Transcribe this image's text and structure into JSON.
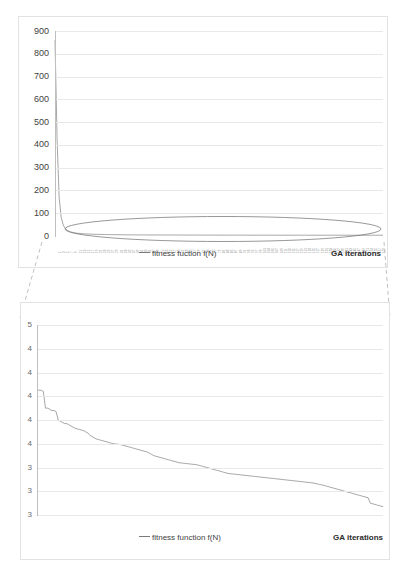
{
  "page": {
    "watermark": "",
    "background": "#ffffff"
  },
  "colors": {
    "series": "#7f7f7f",
    "grid": "#e8e8e8",
    "border": "#e2e2e2",
    "text": "#3f3f3f",
    "connector": "#c0c0c0",
    "annotation": "#6b6b6b"
  },
  "top_chart": {
    "legend_label": "fitness fuction f(N)",
    "x_axis_title": "GA iterations",
    "y_ticks": [
      "0",
      "100",
      "200",
      "300",
      "400",
      "500",
      "600",
      "700",
      "800",
      "900"
    ],
    "x_tick_labels": [
      "1",
      "3",
      "5",
      "7",
      "9",
      "11",
      "13",
      "15",
      "17",
      "19",
      "21",
      "23",
      "25",
      "27",
      "29",
      "31",
      "33",
      "35",
      "37",
      "39",
      "41",
      "43",
      "45",
      "47",
      "49",
      "51",
      "53",
      "55",
      "57",
      "59",
      "61",
      "63",
      "65",
      "67",
      "69",
      "71",
      "73",
      "75",
      "77",
      "79",
      "81",
      "83",
      "85",
      "87",
      "89",
      "91",
      "93",
      "95",
      "97",
      "99",
      "101",
      "103",
      "105",
      "107",
      "109",
      "111",
      "113",
      "115",
      "117",
      "119",
      "121",
      "123",
      "125",
      "127",
      "129",
      "131",
      "133",
      "135",
      "137",
      "139",
      "141",
      "143",
      "145",
      "147",
      "149",
      "151",
      "153",
      "155",
      "157",
      "159"
    ],
    "annotation": "ellipse-highlight"
  },
  "bottom_chart": {
    "legend_label": "fitness function f(N)",
    "x_axis_title": "GA iterations",
    "y_ticks": [
      "5",
      "4",
      "4",
      "4",
      "4",
      "4",
      "3",
      "3",
      "3"
    ],
    "y_ticks_full": [
      "5.0",
      "4.8",
      "4.6",
      "4.4",
      "4.2",
      "4.0",
      "3.8",
      "3.6",
      "3.4"
    ]
  },
  "chart_data": [
    {
      "type": "line",
      "id": "top-chart",
      "title": "",
      "xlabel": "GA iterations",
      "ylabel": "",
      "ylim": [
        0,
        900
      ],
      "xlim": [
        1,
        160
      ],
      "grid": true,
      "legend": "bottom-center",
      "series": [
        {
          "name": "fitness fuction f(N)",
          "values": [
            860,
            430,
            170,
            82,
            48,
            33,
            25,
            20,
            17,
            15,
            13,
            12,
            11,
            10,
            9.5,
            9,
            8.6,
            8.2,
            7.9,
            7.6,
            7.3,
            7.1,
            6.9,
            6.7,
            6.5,
            6.3,
            6.1,
            6.0,
            5.8,
            5.7,
            5.6,
            5.5,
            5.4,
            5.3,
            5.2,
            5.1,
            5.0,
            4.95,
            4.9,
            4.85,
            4.8,
            4.75,
            4.7,
            4.65,
            4.6,
            4.58,
            4.56,
            4.54,
            4.52,
            4.5,
            4.48,
            4.46,
            4.44,
            4.42,
            4.4,
            4.38,
            4.36,
            4.34,
            4.32,
            4.3,
            4.28,
            4.26,
            4.24,
            4.22,
            4.2,
            4.18,
            4.16,
            4.14,
            4.12,
            4.1,
            4.08,
            4.06,
            4.04,
            4.02,
            4.0,
            3.98,
            3.96,
            3.94,
            3.92,
            3.9,
            3.88,
            3.86,
            3.84,
            3.82,
            3.8,
            3.79,
            3.78,
            3.77,
            3.76,
            3.75,
            3.74,
            3.73,
            3.72,
            3.71,
            3.7,
            3.69,
            3.68,
            3.67,
            3.66,
            3.65,
            3.64,
            3.63,
            3.62,
            3.61,
            3.6,
            3.59,
            3.58,
            3.57,
            3.56,
            3.55,
            3.55,
            3.54,
            3.54,
            3.53,
            3.53,
            3.52,
            3.52,
            3.51,
            3.51,
            3.5,
            3.5,
            3.5,
            3.49,
            3.49,
            3.49,
            3.48,
            3.48,
            3.48,
            3.48,
            3.47,
            3.47,
            3.47,
            3.47,
            3.47,
            3.47,
            3.47,
            3.47,
            3.47,
            3.47,
            3.47,
            3.47,
            3.47,
            3.47,
            3.47,
            3.47,
            3.47,
            3.47,
            3.47,
            3.47,
            3.47,
            3.47,
            3.47,
            3.47,
            3.47,
            3.47,
            3.47,
            3.47,
            3.47,
            3.47,
            3.47
          ]
        }
      ]
    },
    {
      "type": "line",
      "id": "bottom-chart",
      "title": "",
      "xlabel": "GA iterations",
      "ylabel": "",
      "ylim": [
        3.4,
        5.0
      ],
      "xlim": [
        1,
        160
      ],
      "grid": true,
      "legend": "bottom-center",
      "note": "zoomed detail of the ellipse-highlighted flat region of the top chart",
      "series": [
        {
          "name": "fitness function f(N)",
          "values": [
            4.46,
            4.45,
            4.45,
            4.44,
            4.3,
            4.3,
            4.29,
            4.28,
            4.28,
            4.27,
            4.2,
            4.19,
            4.18,
            4.17,
            4.17,
            4.16,
            4.15,
            4.14,
            4.13,
            4.125,
            4.12,
            4.115,
            4.11,
            4.1,
            4.09,
            4.07,
            4.06,
            4.05,
            4.04,
            4.035,
            4.03,
            4.025,
            4.02,
            4.015,
            4.01,
            4.005,
            4.0,
            3.998,
            3.996,
            3.994,
            3.99,
            3.985,
            3.98,
            3.975,
            3.97,
            3.965,
            3.96,
            3.955,
            3.95,
            3.945,
            3.94,
            3.935,
            3.93,
            3.92,
            3.91,
            3.9,
            3.895,
            3.89,
            3.885,
            3.88,
            3.875,
            3.87,
            3.865,
            3.86,
            3.855,
            3.85,
            3.845,
            3.84,
            3.838,
            3.836,
            3.834,
            3.832,
            3.83,
            3.828,
            3.826,
            3.824,
            3.82,
            3.815,
            3.81,
            3.805,
            3.8,
            3.795,
            3.79,
            3.785,
            3.78,
            3.775,
            3.77,
            3.765,
            3.76,
            3.755,
            3.75,
            3.748,
            3.746,
            3.744,
            3.742,
            3.74,
            3.738,
            3.736,
            3.734,
            3.732,
            3.73,
            3.728,
            3.726,
            3.724,
            3.722,
            3.72,
            3.718,
            3.716,
            3.714,
            3.712,
            3.71,
            3.708,
            3.706,
            3.704,
            3.702,
            3.7,
            3.698,
            3.696,
            3.694,
            3.692,
            3.69,
            3.688,
            3.686,
            3.684,
            3.682,
            3.68,
            3.678,
            3.676,
            3.674,
            3.672,
            3.67,
            3.666,
            3.662,
            3.658,
            3.654,
            3.65,
            3.645,
            3.64,
            3.635,
            3.63,
            3.625,
            3.62,
            3.615,
            3.61,
            3.605,
            3.6,
            3.595,
            3.59,
            3.585,
            3.58,
            3.575,
            3.57,
            3.565,
            3.56,
            3.555,
            3.55,
            3.545,
            3.5,
            3.495,
            3.49,
            3.485,
            3.48,
            3.475,
            3.47
          ]
        }
      ]
    }
  ]
}
